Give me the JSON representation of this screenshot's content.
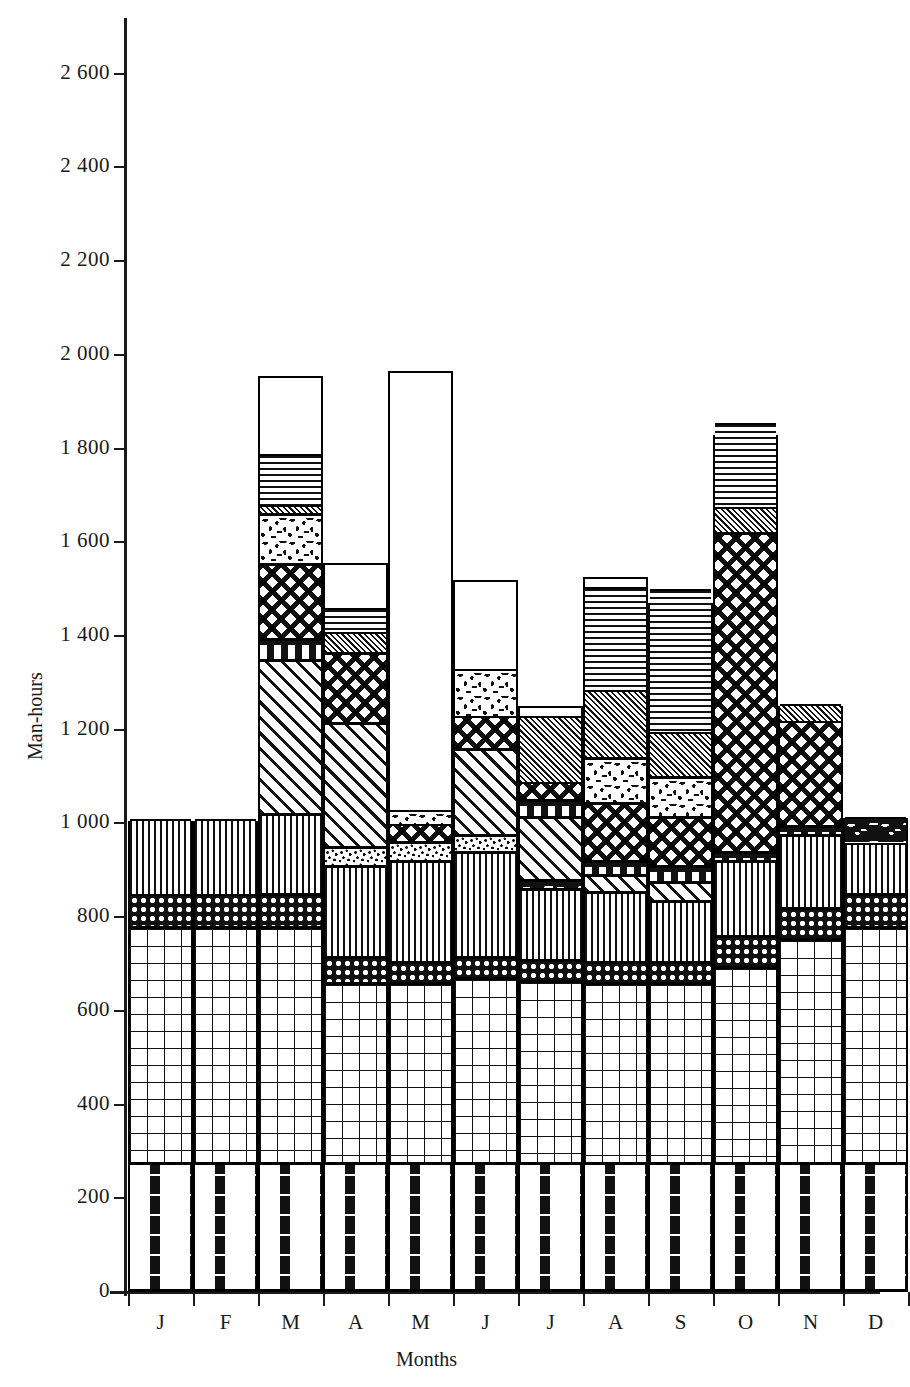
{
  "chart_data": {
    "type": "bar",
    "stacked": true,
    "title": "",
    "subtitle": "",
    "xlabel": "Months",
    "ylabel": "Man-hours",
    "grid": false,
    "legend": "none",
    "ylim": [
      0,
      2700
    ],
    "ytick_labels": [
      "0",
      "200",
      "400",
      "600",
      "800",
      "1 000",
      "1 200",
      "1 400",
      "1 600",
      "1 800",
      "2 000",
      "2 200",
      "2 400",
      "2 600"
    ],
    "ytick_values": [
      0,
      200,
      400,
      600,
      800,
      1000,
      1200,
      1400,
      1600,
      1800,
      2000,
      2200,
      2400,
      2600
    ],
    "categories": [
      "J",
      "F",
      "M",
      "A",
      "M",
      "J",
      "J",
      "A",
      "S",
      "O",
      "N",
      "D"
    ],
    "category_names": [
      "January",
      "February",
      "March",
      "April",
      "May",
      "June",
      "July",
      "August",
      "September",
      "October",
      "November",
      "December"
    ],
    "totals": [
      1005,
      1005,
      1955,
      1555,
      1965,
      1520,
      1250,
      1525,
      1470,
      1828,
      1250,
      1012
    ],
    "series": [
      {
        "name": "dashed-brick",
        "pattern": "p-dashbrick",
        "values": [
          270,
          270,
          270,
          270,
          270,
          270,
          270,
          270,
          270,
          270,
          270,
          270
        ]
      },
      {
        "name": "brick",
        "pattern": "p-brick",
        "values": [
          505,
          505,
          505,
          385,
          385,
          395,
          390,
          385,
          385,
          420,
          480,
          505
        ]
      },
      {
        "name": "checkerboard-dots",
        "pattern": "p-checkdot",
        "values": [
          70,
          70,
          70,
          55,
          45,
          45,
          45,
          45,
          45,
          65,
          65,
          70
        ]
      },
      {
        "name": "vertical-lines",
        "pattern": "p-vlines",
        "values": [
          160,
          160,
          170,
          195,
          215,
          225,
          150,
          150,
          130,
          160,
          155,
          110
        ]
      },
      {
        "name": "squiggle-band",
        "pattern": "p-squiggle",
        "values": [
          0,
          0,
          0,
          0,
          0,
          0,
          20,
          0,
          0,
          0,
          0,
          55
        ]
      },
      {
        "name": "stipple-band",
        "pattern": "p-stipple",
        "values": [
          0,
          0,
          0,
          40,
          40,
          35,
          0,
          0,
          0,
          0,
          0,
          0
        ]
      },
      {
        "name": "diagonal-hatch",
        "pattern": "p-diag",
        "values": [
          0,
          0,
          330,
          265,
          0,
          185,
          135,
          35,
          40,
          0,
          0,
          0
        ]
      },
      {
        "name": "box-band",
        "pattern": "p-boxband",
        "values": [
          0,
          0,
          45,
          0,
          0,
          0,
          35,
          30,
          35,
          20,
          20,
          0
        ]
      },
      {
        "name": "lattice",
        "pattern": "p-lattice",
        "values": [
          0,
          0,
          160,
          150,
          40,
          70,
          40,
          125,
          105,
          680,
          225,
          0
        ]
      },
      {
        "name": "speckle-cloud",
        "pattern": "p-speckle",
        "values": [
          0,
          0,
          105,
          0,
          30,
          100,
          0,
          95,
          85,
          0,
          0,
          0
        ]
      },
      {
        "name": "fine-diagonal",
        "pattern": "p-diagfine",
        "values": [
          0,
          0,
          20,
          45,
          0,
          0,
          140,
          145,
          95,
          55,
          35,
          0
        ]
      },
      {
        "name": "horizontal-lines",
        "pattern": "p-hlines",
        "values": [
          0,
          0,
          110,
          50,
          0,
          0,
          0,
          220,
          305,
          180,
          0,
          0
        ]
      }
    ]
  },
  "axis": {
    "y_title": "Man-hours",
    "x_title": "Months"
  }
}
